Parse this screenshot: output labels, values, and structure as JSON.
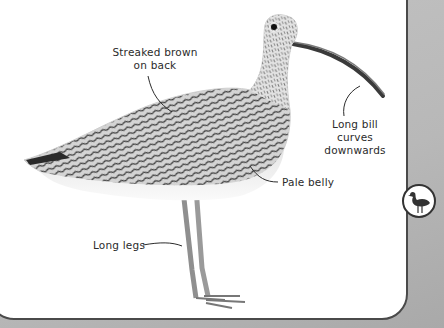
{
  "page": {
    "labels": {
      "back": [
        "Streaked brown",
        "on back"
      ],
      "bill": [
        "Long bill",
        "curves",
        "downwards"
      ],
      "belly": "Pale belly",
      "legs": "Long legs"
    },
    "side_tab_icon": "wading-bird-icon"
  },
  "colors": {
    "panel_border": "#4a4a4a",
    "background": "#b9b9b9",
    "panel": "#ffffff",
    "text": "#2b2b2b"
  }
}
